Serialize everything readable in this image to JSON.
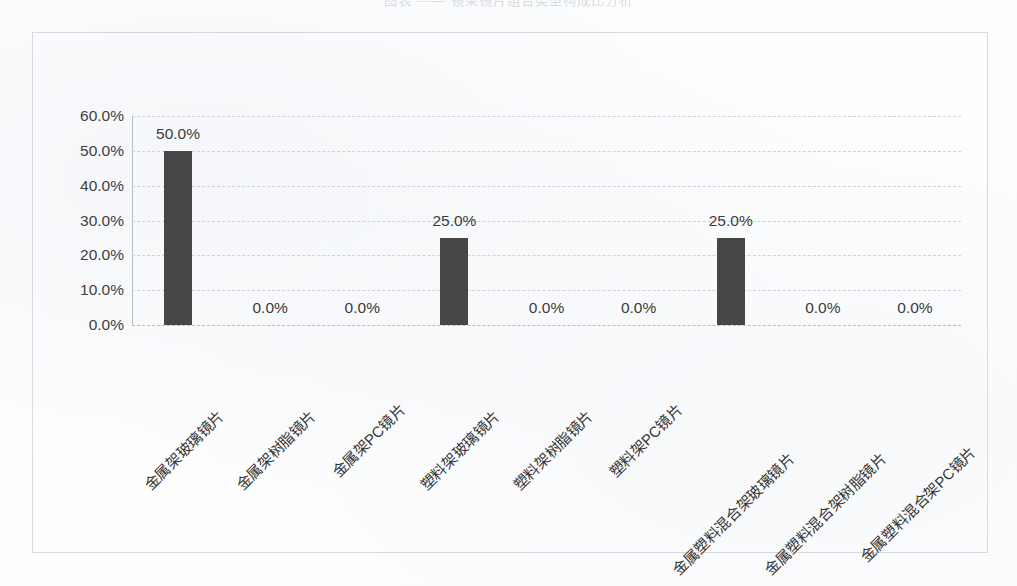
{
  "page": {
    "title_faint": "图表  ——  镜架镜片组合类型构成比分析"
  },
  "chart_data": {
    "type": "bar",
    "title": "",
    "xlabel": "",
    "ylabel": "",
    "ylim": [
      0,
      60
    ],
    "ytick_labels": [
      "60.0%",
      "50.0%",
      "40.0%",
      "30.0%",
      "20.0%",
      "10.0%",
      "0.0%"
    ],
    "ytick_values": [
      60,
      50,
      40,
      30,
      20,
      10,
      0
    ],
    "grid": true,
    "legend": false,
    "bar_color": "#464646",
    "gridline_color": "#cfd2d6",
    "categories": [
      "金属架玻璃镜片",
      "金属架树脂镜片",
      "金属架PC镜片",
      "塑料架玻璃镜片",
      "塑料架树脂镜片",
      "塑料架PC镜片",
      "金属塑料混合架玻璃镜片",
      "金属塑料混合架树脂镜片",
      "金属塑料混合架PC镜片"
    ],
    "values": [
      50.0,
      0.0,
      0.0,
      25.0,
      0.0,
      0.0,
      25.0,
      0.0,
      0.0
    ],
    "data_labels": [
      "50.0%",
      "0.0%",
      "0.0%",
      "25.0%",
      "0.0%",
      "0.0%",
      "25.0%",
      "0.0%",
      "0.0%"
    ]
  }
}
